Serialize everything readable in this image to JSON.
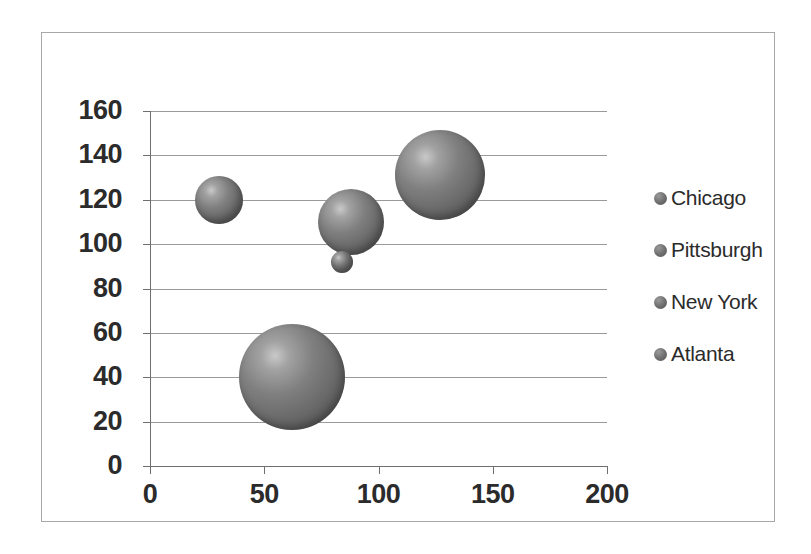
{
  "chart_data": {
    "type": "scatter",
    "title": "",
    "xlabel": "",
    "ylabel": "",
    "xlim": [
      0,
      200
    ],
    "ylim": [
      0,
      160
    ],
    "grid": true,
    "legend_position": "right",
    "x_ticks": [
      "0",
      "50",
      "100",
      "150",
      "200"
    ],
    "x_tick_values": [
      0,
      50,
      100,
      150,
      200
    ],
    "y_ticks": [
      "0",
      "20",
      "40",
      "60",
      "80",
      "100",
      "120",
      "140",
      "160"
    ],
    "y_tick_values": [
      0,
      20,
      40,
      60,
      80,
      100,
      120,
      140,
      160
    ],
    "legend": [
      "Chicago",
      "Pittsburgh",
      "New York",
      "Atlanta"
    ],
    "bubble_color": "#6b6b6b",
    "series": [
      {
        "name": "Chicago",
        "x": 30,
        "y": 120,
        "size": 24
      },
      {
        "name": "Pittsburgh",
        "x": 88,
        "y": 110,
        "size": 33
      },
      {
        "name": "New York",
        "x": 84,
        "y": 92,
        "size": 11
      },
      {
        "name": "Atlanta",
        "x": 127,
        "y": 131,
        "size": 45
      },
      {
        "name": "Atlanta",
        "x": 62,
        "y": 40,
        "size": 53
      }
    ]
  },
  "legend": {
    "items": [
      {
        "label": "Chicago"
      },
      {
        "label": "Pittsburgh"
      },
      {
        "label": "New York"
      },
      {
        "label": "Atlanta"
      }
    ]
  }
}
